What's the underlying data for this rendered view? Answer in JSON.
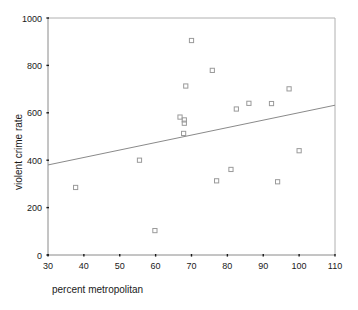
{
  "chart_data": {
    "type": "scatter",
    "title": "",
    "xlabel": "percent metropolitan",
    "ylabel": "violent crime rate",
    "xlim": [
      30,
      110
    ],
    "ylim": [
      0,
      1000
    ],
    "xticks": [
      30,
      40,
      50,
      60,
      70,
      80,
      90,
      100,
      110
    ],
    "xtick_labels": [
      "30",
      "40",
      "50",
      "60",
      "70",
      "80",
      "90",
      "100",
      "110"
    ],
    "yticks": [
      0,
      200,
      400,
      600,
      800,
      1000
    ],
    "ytick_labels": [
      "0",
      "200",
      "400",
      "600",
      "800",
      "1000"
    ],
    "grid": false,
    "legend": null,
    "marker": "open-square",
    "marker_color": "#9a9a9a",
    "points": [
      {
        "x": 37.7,
        "y": 285
      },
      {
        "x": 55.5,
        "y": 400
      },
      {
        "x": 59.8,
        "y": 103
      },
      {
        "x": 66.8,
        "y": 582
      },
      {
        "x": 68.0,
        "y": 570
      },
      {
        "x": 68.0,
        "y": 556
      },
      {
        "x": 67.8,
        "y": 513
      },
      {
        "x": 68.4,
        "y": 713
      },
      {
        "x": 70.0,
        "y": 905
      },
      {
        "x": 75.8,
        "y": 779
      },
      {
        "x": 77.0,
        "y": 313
      },
      {
        "x": 81.0,
        "y": 361
      },
      {
        "x": 82.5,
        "y": 616
      },
      {
        "x": 86.0,
        "y": 640
      },
      {
        "x": 92.3,
        "y": 639
      },
      {
        "x": 94.0,
        "y": 309
      },
      {
        "x": 97.2,
        "y": 701
      },
      {
        "x": 100.0,
        "y": 440
      }
    ],
    "fit_line": {
      "type": "linear-regression",
      "x_start": 30,
      "y_start": 380,
      "x_end": 110,
      "y_end": 632,
      "color": "#8a8a8a"
    },
    "series": [
      {
        "name": "violent crime rate vs percent metropolitan",
        "x": [
          37.7,
          55.5,
          59.8,
          66.8,
          68.0,
          68.0,
          67.8,
          68.4,
          70.0,
          75.8,
          77.0,
          81.0,
          82.5,
          86.0,
          92.3,
          94.0,
          97.2,
          100.0
        ],
        "values": [
          285,
          400,
          103,
          582,
          570,
          556,
          513,
          713,
          905,
          779,
          313,
          361,
          616,
          640,
          639,
          309,
          701,
          440
        ]
      }
    ]
  },
  "layout": {
    "plot_left_px": 48,
    "plot_right_px": 335,
    "plot_top_px": 18,
    "plot_bottom_px": 255,
    "background": "#ffffff"
  }
}
